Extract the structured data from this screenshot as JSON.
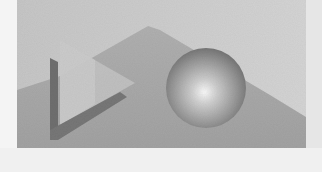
{
  "image": {
    "width": 322,
    "height": 172,
    "description": "Grayscale rendered 3D scene: translucent triangle with L-shaped shadow beside a shaded sphere on a gray stepped backdrop",
    "colors": {
      "margin": "#f4f4f4",
      "backdrop_light": "#c8c8c8",
      "backdrop_lighter": "#d2d2d2",
      "ground_mid": "#a9a9a9",
      "ground_dark": "#9c9c9c",
      "triangle_fill": "#bdbdbd",
      "shadow_dark": "#6e6e6e",
      "sphere_highlight": "#f6f6f6",
      "sphere_mid": "#a8a8a8",
      "sphere_edge": "#6c6c6c"
    },
    "objects": [
      {
        "name": "backdrop",
        "shape": "rectangle"
      },
      {
        "name": "ground-ridge",
        "shape": "polygon"
      },
      {
        "name": "triangle",
        "shape": "triangle"
      },
      {
        "name": "triangle-shadow",
        "shape": "L-shape"
      },
      {
        "name": "sphere",
        "shape": "circle",
        "cx": 206,
        "cy": 88,
        "r": 40
      }
    ]
  }
}
